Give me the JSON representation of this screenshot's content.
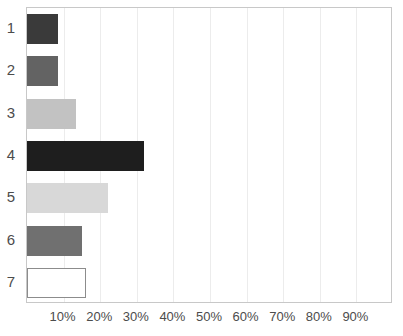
{
  "chart_data": {
    "type": "bar",
    "orientation": "horizontal",
    "title": "",
    "subtitle": "",
    "xlabel": "",
    "ylabel": "",
    "categories": [
      "1",
      "2",
      "3",
      "4",
      "5",
      "6",
      "7"
    ],
    "values": [
      8.5,
      8.5,
      13.5,
      32,
      22,
      15,
      16
    ],
    "xlim": [
      0,
      100
    ],
    "ylim": [
      0,
      7
    ],
    "xtick_labels": [
      "10%",
      "20%",
      "30%",
      "40%",
      "50%",
      "60%",
      "70%",
      "80%",
      "90%"
    ],
    "xtick_values": [
      10,
      20,
      30,
      40,
      50,
      60,
      70,
      80,
      90
    ],
    "ytick_labels": [
      "1",
      "2",
      "3",
      "4",
      "5",
      "6",
      "7"
    ],
    "grid": true,
    "grid_axis": "x",
    "legend": false,
    "legend_position": "none",
    "bar_colors": [
      "#3a3a3a",
      "#636363",
      "#c2c2c2",
      "#1e1e1e",
      "#d8d8d8",
      "#707070",
      "#ffffff"
    ],
    "bar_outline_colors": [
      "none",
      "none",
      "none",
      "none",
      "none",
      "none",
      "#8c8c8c"
    ],
    "series": [
      {
        "name": "",
        "values": [
          8.5,
          8.5,
          13.5,
          32,
          22,
          15,
          16
        ]
      }
    ],
    "annotations": [],
    "axis_color": "#c8c8c8",
    "gridline_color": "#ececec",
    "tick_label_color": "#4c4c4c",
    "background_color": "#ffffff"
  }
}
